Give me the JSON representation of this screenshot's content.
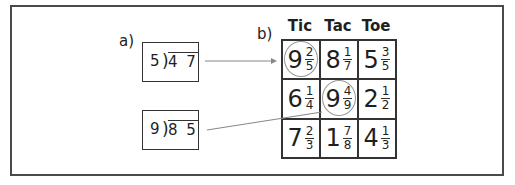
{
  "labels": {
    "part_a": "a)",
    "part_b": "b)"
  },
  "division_problems": [
    {
      "divisor": "5",
      "dividend": "4 7"
    },
    {
      "divisor": "9",
      "dividend": "8 5"
    }
  ],
  "grid": {
    "headers": [
      "Tic",
      "Tac",
      "Toe"
    ],
    "cells": [
      {
        "whole": "9",
        "num": "2",
        "den": "5",
        "circled": true
      },
      {
        "whole": "8",
        "num": "1",
        "den": "7",
        "circled": false
      },
      {
        "whole": "5",
        "num": "3",
        "den": "5",
        "circled": false
      },
      {
        "whole": "6",
        "num": "1",
        "den": "4",
        "circled": false
      },
      {
        "whole": "9",
        "num": "4",
        "den": "9",
        "circled": true
      },
      {
        "whole": "2",
        "num": "1",
        "den": "2",
        "circled": false
      },
      {
        "whole": "7",
        "num": "2",
        "den": "3",
        "circled": false
      },
      {
        "whole": "1",
        "num": "7",
        "den": "8",
        "circled": false
      },
      {
        "whole": "4",
        "num": "1",
        "den": "3",
        "circled": false
      }
    ]
  },
  "connectors": [
    {
      "from": "5 ) 47",
      "to": "9 2/5",
      "arrow": true
    },
    {
      "from": "9 ) 85",
      "to": "9 4/9",
      "arrow": false
    }
  ],
  "colors": {
    "frame": "#4a4a4a",
    "circle": "#999999",
    "connector": "#888888"
  }
}
